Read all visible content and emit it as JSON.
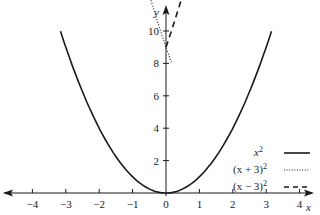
{
  "chart_data": {
    "type": "line",
    "title": "",
    "xlabel": "x",
    "ylabel": "y",
    "xlim": [
      -4.3,
      4.4
    ],
    "ylim": [
      0,
      10.5
    ],
    "grid": false,
    "legend_position": "lower right",
    "x_ticks": [
      "−4",
      "−3",
      "−2",
      "−1",
      "0",
      "1",
      "2",
      "3",
      "4"
    ],
    "x_tick_values": [
      -4,
      -3,
      -2,
      -1,
      0,
      1,
      2,
      3,
      4
    ],
    "y_ticks": [
      "2",
      "4",
      "6",
      "8",
      "10"
    ],
    "y_tick_values": [
      2,
      4,
      6,
      8,
      10
    ],
    "series": [
      {
        "name": "x²",
        "label_main": "x",
        "label_sup": "2",
        "style": "solid",
        "x": [
          -3.16,
          -3,
          -2,
          -1,
          0,
          1,
          2,
          3,
          3.16
        ],
        "values": [
          10,
          9,
          4,
          1,
          0,
          1,
          4,
          9,
          10
        ]
      },
      {
        "name": "(x + 3)²",
        "label_main": "(x + 3)",
        "label_sup": "2",
        "style": "dotted",
        "x": [
          -4,
          -3,
          -2,
          -1,
          0,
          0.16
        ],
        "values": [
          1,
          0,
          1,
          4,
          9,
          10
        ]
      },
      {
        "name": "(x − 3)²",
        "label_main": "(x − 3)",
        "label_sup": "2",
        "style": "dashed",
        "x": [
          0,
          1,
          2,
          3,
          4
        ],
        "values": [
          9,
          4,
          1,
          0,
          1
        ]
      }
    ]
  },
  "axes": {
    "x_label": "x",
    "y_label": "y"
  },
  "legend": {
    "items": [
      {
        "main": "x",
        "sup": "2"
      },
      {
        "main": "(x + 3)",
        "sup": "2"
      },
      {
        "main": "(x − 3)",
        "sup": "2"
      }
    ]
  },
  "colors": {
    "line": "#1a1a1a",
    "text": "#222222"
  }
}
